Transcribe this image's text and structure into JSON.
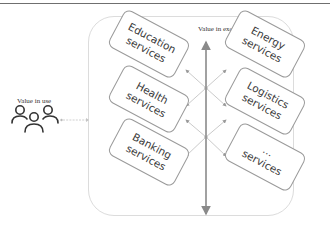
{
  "diagram": {
    "value_in_use_label": "Value in use",
    "value_in_exchange_label": "Value in exchange",
    "users_icon": "users-group-icon",
    "cards": [
      {
        "id": "education",
        "line1": "Education",
        "line2": "services",
        "column": "left"
      },
      {
        "id": "health",
        "line1": "Health",
        "line2": "services",
        "column": "left"
      },
      {
        "id": "banking",
        "line1": "Banking",
        "line2": "services",
        "column": "left"
      },
      {
        "id": "energy",
        "line1": "Energy",
        "line2": "services",
        "column": "right"
      },
      {
        "id": "logistics",
        "line1": "Logistics",
        "line2": "services",
        "column": "right"
      },
      {
        "id": "other",
        "line1": "...",
        "line2": "services",
        "column": "right"
      }
    ],
    "colors": {
      "card_border": "#9a9a9a",
      "container_border": "#dcdcdc",
      "axis_arrow": "#8a8a8a",
      "text": "#3a3a3a"
    }
  }
}
